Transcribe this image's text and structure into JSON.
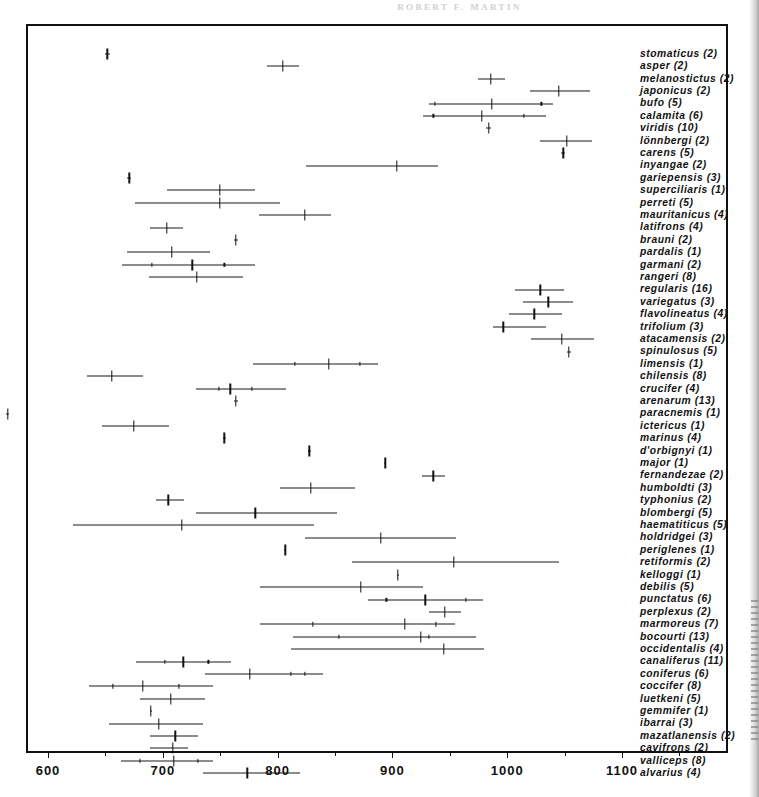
{
  "page": {
    "running_head": "ROBERT F. MARTIN"
  },
  "chart_data": {
    "type": "scatter",
    "title": "",
    "xlabel": "",
    "ylabel": "",
    "xlim": [
      558,
      1169
    ],
    "grid": false,
    "legend": false,
    "axis_ticks_major": [
      600,
      700,
      800,
      900,
      1000,
      1100
    ],
    "axis_ticks_minor": [
      650,
      750,
      850,
      950,
      1050,
      1150
    ],
    "x_tick_labels": [
      "600",
      "700",
      "800",
      "900",
      "1000",
      "1100"
    ],
    "rows": [
      {
        "label": "stomaticus (2)",
        "n": 2,
        "mean": 650,
        "range": [
          648,
          652
        ],
        "sd": null
      },
      {
        "label": "asper (2)",
        "n": 2,
        "mean": 803,
        "range": [
          789,
          817
        ],
        "sd": null
      },
      {
        "label": "melanostictus (2)",
        "n": 2,
        "mean": 984,
        "range": [
          973,
          996
        ],
        "sd": null
      },
      {
        "label": "japonicus (2)",
        "n": 2,
        "mean": 1043,
        "range": [
          1018,
          1070
        ],
        "sd": null
      },
      {
        "label": "bufo (5)",
        "n": 5,
        "mean": 985,
        "range": [
          930,
          1038
        ],
        "sd": [
          935,
          1028
        ]
      },
      {
        "label": "calamita (6)",
        "n": 6,
        "mean": 976,
        "range": [
          925,
          1032
        ],
        "sd": [
          934,
          1013
        ]
      },
      {
        "label": "viridis (10)",
        "n": 10,
        "mean": 982,
        "range": [
          980,
          984
        ],
        "sd": null
      },
      {
        "label": "lönnbergi (2)",
        "n": 2,
        "mean": 1050,
        "range": [
          1027,
          1072
        ],
        "sd": null
      },
      {
        "label": "carens (5)",
        "n": 5,
        "mean": 1047,
        "range": [
          1045,
          1049
        ],
        "sd": null
      },
      {
        "label": "inyangae (2)",
        "n": 2,
        "mean": 902,
        "range": [
          823,
          938
        ],
        "sd": null
      },
      {
        "label": "gariepensis (3)",
        "n": 3,
        "mean": 669,
        "range": [
          667,
          671
        ],
        "sd": null
      },
      {
        "label": "superciliaris (1)",
        "n": 1,
        "mean": 748,
        "range": [
          702,
          779
        ],
        "sd": null
      },
      {
        "label": "perreti (5)",
        "n": 5,
        "mean": 748,
        "range": [
          674,
          800
        ],
        "sd": null
      },
      {
        "label": "mauritanicus (4)",
        "n": 4,
        "mean": 822,
        "range": [
          782,
          845
        ],
        "sd": null
      },
      {
        "label": "latifrons (4)",
        "n": 4,
        "mean": 702,
        "range": [
          687,
          716
        ],
        "sd": null
      },
      {
        "label": "brauni (2)",
        "n": 2,
        "mean": 762,
        "range": [
          760,
          764
        ],
        "sd": null
      },
      {
        "label": "pardalis (1)",
        "n": 1,
        "mean": 706,
        "range": [
          667,
          739
        ],
        "sd": null
      },
      {
        "label": "garmani (2)",
        "n": 2,
        "mean": 724,
        "range": [
          663,
          779
        ],
        "sd": [
          689,
          752
        ]
      },
      {
        "label": "rangeri (8)",
        "n": 8,
        "mean": 728,
        "range": [
          686,
          768
        ],
        "sd": null
      },
      {
        "label": "regularis (16)",
        "n": 16,
        "mean": 1027,
        "range": [
          1005,
          1048
        ],
        "sd": null
      },
      {
        "label": "variegatus (3)",
        "n": 3,
        "mean": 1034,
        "range": [
          1012,
          1056
        ],
        "sd": null
      },
      {
        "label": "flavolineatus (4)",
        "n": 4,
        "mean": 1022,
        "range": [
          1000,
          1046
        ],
        "sd": null
      },
      {
        "label": "trifolium (3)",
        "n": 3,
        "mean": 995,
        "range": [
          986,
          1032
        ],
        "sd": null
      },
      {
        "label": "atacamensis (2)",
        "n": 2,
        "mean": 1046,
        "range": [
          1019,
          1074
        ],
        "sd": null
      },
      {
        "label": "spinulosus (5)",
        "n": 5,
        "mean": 1052,
        "range": [
          1050,
          1054
        ],
        "sd": null
      },
      {
        "label": "limensis (1)",
        "n": 1,
        "mean": 843,
        "range": [
          777,
          886
        ],
        "sd": [
          813,
          870
        ]
      },
      {
        "label": "chilensis (8)",
        "n": 8,
        "mean": 654,
        "range": [
          632,
          681
        ],
        "sd": null
      },
      {
        "label": "crucifer (4)",
        "n": 4,
        "mean": 757,
        "range": [
          727,
          806
        ],
        "sd": [
          747,
          776
        ]
      },
      {
        "label": "arenarum (13)",
        "n": 13,
        "mean": 762,
        "range": [
          760,
          764
        ],
        "sd": null
      },
      {
        "label": "paracnemis (1)",
        "n": 1,
        "mean": 563,
        "range": [
          562,
          564
        ],
        "sd": null
      },
      {
        "label": "ictericus (1)",
        "n": 1,
        "mean": 673,
        "range": [
          645,
          704
        ],
        "sd": null
      },
      {
        "label": "marinus (4)",
        "n": 4,
        "mean": 752,
        "range": [
          751,
          753
        ],
        "sd": null
      },
      {
        "label": "d'orbignyi (1)",
        "n": 1,
        "mean": 826,
        "range": [
          825,
          827
        ],
        "sd": null
      },
      {
        "label": "major (1)",
        "n": 1,
        "mean": 892,
        "range": [
          891,
          893
        ],
        "sd": null
      },
      {
        "label": "fernandezae (2)",
        "n": 2,
        "mean": 934,
        "range": [
          924,
          944
        ],
        "sd": null
      },
      {
        "label": "humboldti (3)",
        "n": 3,
        "mean": 827,
        "range": [
          800,
          866
        ],
        "sd": null
      },
      {
        "label": "typhonius (2)",
        "n": 2,
        "mean": 703,
        "range": [
          692,
          717
        ],
        "sd": null
      },
      {
        "label": "blombergi (5)",
        "n": 5,
        "mean": 779,
        "range": [
          727,
          850
        ],
        "sd": null
      },
      {
        "label": "haematiticus (5)",
        "n": 5,
        "mean": 715,
        "range": [
          620,
          830
        ],
        "sd": null
      },
      {
        "label": "holdridgei (3)",
        "n": 3,
        "mean": 888,
        "range": [
          822,
          954
        ],
        "sd": null
      },
      {
        "label": "periglenes (1)",
        "n": 1,
        "mean": 805,
        "range": [
          804,
          806
        ],
        "sd": null
      },
      {
        "label": "retiformis (2)",
        "n": 2,
        "mean": 952,
        "range": [
          863,
          1043
        ],
        "sd": null
      },
      {
        "label": "kelloggi (1)",
        "n": 1,
        "mean": 903,
        "range": [
          902,
          904
        ],
        "sd": null
      },
      {
        "label": "debilis (5)",
        "n": 5,
        "mean": 871,
        "range": [
          783,
          925
        ],
        "sd": null
      },
      {
        "label": "punctatus (6)",
        "n": 6,
        "mean": 927,
        "range": [
          877,
          977
        ],
        "sd": [
          893,
          962
        ]
      },
      {
        "label": "perplexus (2)",
        "n": 2,
        "mean": 944,
        "range": [
          930,
          958
        ],
        "sd": null
      },
      {
        "label": "marmoreus (7)",
        "n": 7,
        "mean": 909,
        "range": [
          783,
          953
        ],
        "sd": [
          829,
          936
        ]
      },
      {
        "label": "bocourti (13)",
        "n": 13,
        "mean": 923,
        "range": [
          812,
          971
        ],
        "sd": [
          852,
          930
        ]
      },
      {
        "label": "occidentalis (4)",
        "n": 4,
        "mean": 943,
        "range": [
          810,
          978
        ],
        "sd": null
      },
      {
        "label": "canaliferus (11)",
        "n": 11,
        "mean": 716,
        "range": [
          675,
          758
        ],
        "sd": [
          700,
          738
        ]
      },
      {
        "label": "coniferus (6)",
        "n": 6,
        "mean": 774,
        "range": [
          735,
          838
        ],
        "sd": [
          810,
          822
        ]
      },
      {
        "label": "coccifer (8)",
        "n": 8,
        "mean": 681,
        "range": [
          634,
          742
        ],
        "sd": [
          655,
          712
        ]
      },
      {
        "label": "luetkeni (5)",
        "n": 5,
        "mean": 705,
        "range": [
          678,
          735
        ],
        "sd": null
      },
      {
        "label": "gemmifer (1)",
        "n": 1,
        "mean": 688,
        "range": [
          687,
          689
        ],
        "sd": null
      },
      {
        "label": "ibarrai (3)",
        "n": 3,
        "mean": 695,
        "range": [
          651,
          733
        ],
        "sd": null
      },
      {
        "label": "mazatlanensis (2)",
        "n": 2,
        "mean": 709,
        "range": [
          687,
          729
        ],
        "sd": null
      },
      {
        "label": "cavifrons (2)",
        "n": 2,
        "mean": 707,
        "range": [
          687,
          720
        ],
        "sd": null
      },
      {
        "label": "valliceps (8)",
        "n": 8,
        "mean": 708,
        "range": [
          662,
          742
        ],
        "sd": [
          678,
          729
        ]
      },
      {
        "label": "alvarius (4)",
        "n": 4,
        "mean": 772,
        "range": [
          733,
          818
        ],
        "sd": null
      }
    ]
  }
}
